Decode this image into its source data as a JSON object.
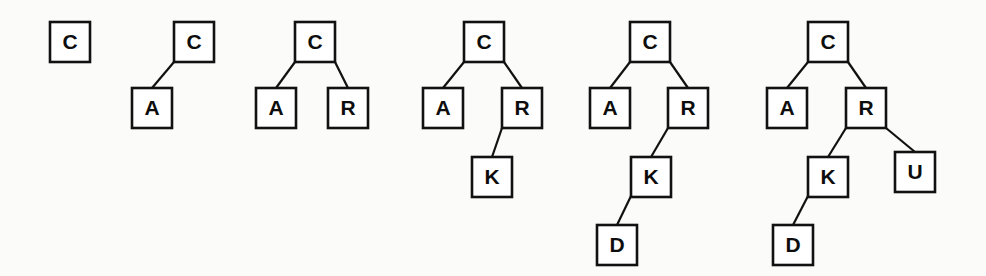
{
  "figure": {
    "background_color": "#fbfbfa",
    "node_fill": "#ffffff",
    "node_stroke": "#111111",
    "edge_color": "#111111",
    "canvas": {
      "width": 986,
      "height": 276
    },
    "node_size": 40,
    "font_size_px": 21
  },
  "chart_data": {
    "type": "diagram",
    "diagram_kind": "binary-search-tree-insertion-sequence",
    "insertion_order": [
      "C",
      "A",
      "R",
      "K",
      "D",
      "U"
    ],
    "stage_count": 6,
    "levels_y": [
      22,
      88,
      157,
      225
    ],
    "node_size": 40,
    "stages": [
      {
        "index": 1,
        "inserted_key": "C",
        "keys": [
          "C"
        ],
        "root": "C",
        "nodes": [
          {
            "id": "s1-C",
            "label": "C",
            "x": 50,
            "y": 22,
            "level": 0,
            "side": "root",
            "parent": null
          }
        ],
        "edges": []
      },
      {
        "index": 2,
        "inserted_key": "A",
        "keys": [
          "C",
          "A"
        ],
        "root": "C",
        "nodes": [
          {
            "id": "s2-C",
            "label": "C",
            "x": 174,
            "y": 22,
            "level": 0,
            "side": "root",
            "parent": null
          },
          {
            "id": "s2-A",
            "label": "A",
            "x": 132,
            "y": 88,
            "level": 1,
            "side": "left",
            "parent": "s2-C"
          }
        ],
        "edges": [
          {
            "from": "s2-C",
            "to": "s2-A",
            "from_x": 174,
            "from_y": 62,
            "to_x": 152,
            "to_y": 88
          }
        ]
      },
      {
        "index": 3,
        "inserted_key": "R",
        "keys": [
          "C",
          "A",
          "R"
        ],
        "root": "C",
        "nodes": [
          {
            "id": "s3-C",
            "label": "C",
            "x": 295,
            "y": 22,
            "level": 0,
            "side": "root",
            "parent": null
          },
          {
            "id": "s3-A",
            "label": "A",
            "x": 256,
            "y": 88,
            "level": 1,
            "side": "left",
            "parent": "s3-C"
          },
          {
            "id": "s3-R",
            "label": "R",
            "x": 328,
            "y": 88,
            "level": 1,
            "side": "right",
            "parent": "s3-C"
          }
        ],
        "edges": [
          {
            "from": "s3-C",
            "to": "s3-A",
            "from_x": 295,
            "from_y": 62,
            "to_x": 276,
            "to_y": 88
          },
          {
            "from": "s3-C",
            "to": "s3-R",
            "from_x": 335,
            "from_y": 62,
            "to_x": 348,
            "to_y": 88
          }
        ]
      },
      {
        "index": 4,
        "inserted_key": "K",
        "keys": [
          "C",
          "A",
          "R",
          "K"
        ],
        "root": "C",
        "nodes": [
          {
            "id": "s4-C",
            "label": "C",
            "x": 464,
            "y": 22,
            "level": 0,
            "side": "root",
            "parent": null
          },
          {
            "id": "s4-A",
            "label": "A",
            "x": 423,
            "y": 88,
            "level": 1,
            "side": "left",
            "parent": "s4-C"
          },
          {
            "id": "s4-R",
            "label": "R",
            "x": 502,
            "y": 88,
            "level": 1,
            "side": "right",
            "parent": "s4-C"
          },
          {
            "id": "s4-K",
            "label": "K",
            "x": 472,
            "y": 157,
            "level": 2,
            "side": "left",
            "parent": "s4-R"
          }
        ],
        "edges": [
          {
            "from": "s4-C",
            "to": "s4-A",
            "from_x": 464,
            "from_y": 62,
            "to_x": 443,
            "to_y": 88
          },
          {
            "from": "s4-C",
            "to": "s4-R",
            "from_x": 504,
            "from_y": 62,
            "to_x": 522,
            "to_y": 88
          },
          {
            "from": "s4-R",
            "to": "s4-K",
            "from_x": 502,
            "from_y": 128,
            "to_x": 492,
            "to_y": 157
          }
        ]
      },
      {
        "index": 5,
        "inserted_key": "D",
        "keys": [
          "C",
          "A",
          "R",
          "K",
          "D"
        ],
        "root": "C",
        "nodes": [
          {
            "id": "s5-C",
            "label": "C",
            "x": 630,
            "y": 22,
            "level": 0,
            "side": "root",
            "parent": null
          },
          {
            "id": "s5-A",
            "label": "A",
            "x": 590,
            "y": 88,
            "level": 1,
            "side": "left",
            "parent": "s5-C"
          },
          {
            "id": "s5-R",
            "label": "R",
            "x": 668,
            "y": 88,
            "level": 1,
            "side": "right",
            "parent": "s5-C"
          },
          {
            "id": "s5-K",
            "label": "K",
            "x": 631,
            "y": 157,
            "level": 2,
            "side": "left",
            "parent": "s5-R"
          },
          {
            "id": "s5-D",
            "label": "D",
            "x": 597,
            "y": 225,
            "level": 3,
            "side": "left",
            "parent": "s5-K"
          }
        ],
        "edges": [
          {
            "from": "s5-C",
            "to": "s5-A",
            "from_x": 630,
            "from_y": 62,
            "to_x": 610,
            "to_y": 88
          },
          {
            "from": "s5-C",
            "to": "s5-R",
            "from_x": 670,
            "from_y": 62,
            "to_x": 688,
            "to_y": 88
          },
          {
            "from": "s5-R",
            "to": "s5-K",
            "from_x": 668,
            "from_y": 128,
            "to_x": 651,
            "to_y": 157
          },
          {
            "from": "s5-K",
            "to": "s5-D",
            "from_x": 631,
            "from_y": 196,
            "to_x": 617,
            "to_y": 225
          }
        ]
      },
      {
        "index": 6,
        "inserted_key": "U",
        "keys": [
          "C",
          "A",
          "R",
          "K",
          "D",
          "U"
        ],
        "root": "C",
        "nodes": [
          {
            "id": "s6-C",
            "label": "C",
            "x": 808,
            "y": 22,
            "level": 0,
            "side": "root",
            "parent": null
          },
          {
            "id": "s6-A",
            "label": "A",
            "x": 767,
            "y": 88,
            "level": 1,
            "side": "left",
            "parent": "s6-C"
          },
          {
            "id": "s6-R",
            "label": "R",
            "x": 846,
            "y": 88,
            "level": 1,
            "side": "right",
            "parent": "s6-C"
          },
          {
            "id": "s6-K",
            "label": "K",
            "x": 808,
            "y": 157,
            "level": 2,
            "side": "left",
            "parent": "s6-R"
          },
          {
            "id": "s6-U",
            "label": "U",
            "x": 895,
            "y": 152,
            "level": 2,
            "side": "right",
            "parent": "s6-R"
          },
          {
            "id": "s6-D",
            "label": "D",
            "x": 773,
            "y": 225,
            "level": 3,
            "side": "left",
            "parent": "s6-K"
          }
        ],
        "edges": [
          {
            "from": "s6-C",
            "to": "s6-A",
            "from_x": 808,
            "from_y": 62,
            "to_x": 787,
            "to_y": 88
          },
          {
            "from": "s6-C",
            "to": "s6-R",
            "from_x": 848,
            "from_y": 62,
            "to_x": 866,
            "to_y": 88
          },
          {
            "from": "s6-R",
            "to": "s6-K",
            "from_x": 846,
            "from_y": 128,
            "to_x": 828,
            "to_y": 157
          },
          {
            "from": "s6-R",
            "to": "s6-U",
            "from_x": 886,
            "from_y": 128,
            "to_x": 915,
            "to_y": 152
          },
          {
            "from": "s6-K",
            "to": "s6-D",
            "from_x": 808,
            "from_y": 196,
            "to_x": 793,
            "to_y": 225
          }
        ]
      }
    ]
  }
}
